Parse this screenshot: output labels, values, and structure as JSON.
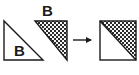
{
  "diagram": {
    "title": "",
    "background_color": "#ffffff",
    "stroke_color": "#1a1a1a",
    "fill_white": "#ffffff",
    "texture_dark": "#2b2b2b",
    "texture_light": "#f2f2f2",
    "shapes": [
      {
        "id": "left-triangle",
        "name": "white-right-triangle",
        "label": "B",
        "fill": "plain-white",
        "orientation": "right-angle-bottom-left",
        "points": "4,21 4,60 43,60",
        "label_x": 14,
        "label_y": 56
      },
      {
        "id": "middle-triangle",
        "name": "textured-right-triangle",
        "label": "B",
        "fill": "checker-texture",
        "orientation": "right-angle-top-right",
        "points": "35,21 67,21 67,60",
        "label_x": 42,
        "label_y": 16
      },
      {
        "id": "result-square",
        "name": "combined-square",
        "label": "",
        "fill": "half-textured-upper-right",
        "orientation": "square",
        "points": "100,21 136,21 136,60 100,60",
        "diagonal": "100,21 136,60"
      }
    ],
    "arrow": {
      "name": "rightward-arrow",
      "label": "",
      "x1": 73,
      "y1": 40,
      "x2": 94,
      "y2": 40
    }
  }
}
